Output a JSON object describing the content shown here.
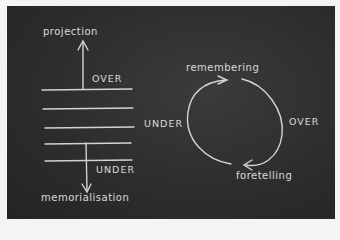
{
  "diagram": {
    "left": {
      "top_label": "projection",
      "over_label": "OVER",
      "under_label": "UNDER",
      "bottom_label": "memorialisation",
      "line_count": 5
    },
    "right": {
      "top_label": "remembering",
      "left_label": "UNDER",
      "right_label": "OVER",
      "bottom_label": "foretelling"
    },
    "colors": {
      "board": "#2c2d2c",
      "chalk": "#e6e6e0",
      "frame": "#f4f4f4"
    }
  }
}
